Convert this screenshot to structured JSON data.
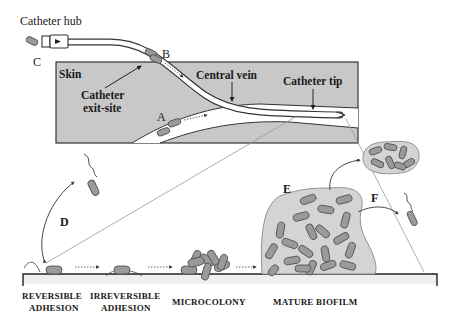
{
  "figure": {
    "labels": {
      "catheter_hub": "Catheter hub",
      "skin": "Skin",
      "exit_site_line1": "Catheter",
      "exit_site_line2": "exit-site",
      "central_vein": "Central vein",
      "catheter_tip": "Catheter tip",
      "route_a": "A",
      "route_b": "B",
      "route_c": "C",
      "stage_d": "D",
      "stage_e": "E",
      "stage_f": "F"
    },
    "stages": [
      {
        "line1": "REVERSIBLE",
        "line2": "ADHESION"
      },
      {
        "line1": "IRREVERSIBLE",
        "line2": "ADHESION"
      },
      {
        "line1": "MICROCOLONY",
        "line2": ""
      },
      {
        "line1": "MATURE BIOFILM",
        "line2": ""
      }
    ],
    "colors": {
      "skin_fill": "#c8c8c8",
      "bacteria_fill": "#9a9a9a",
      "biofilm_matrix": "#d4d4d4",
      "line": "#222222"
    }
  }
}
